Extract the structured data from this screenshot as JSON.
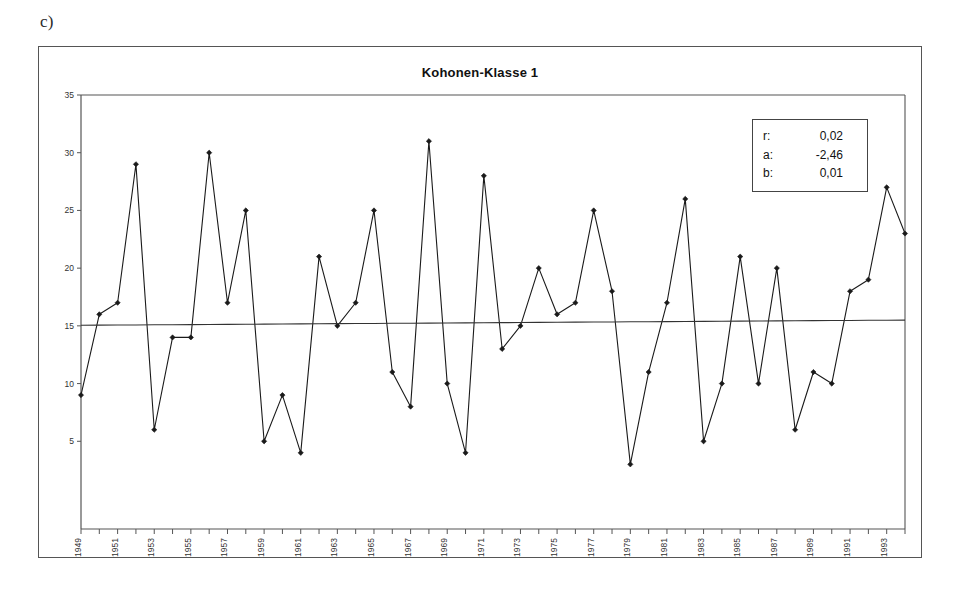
{
  "figure": {
    "panel_label": "c)"
  },
  "stats_box": {
    "rows": [
      {
        "key": "r:",
        "value": "0,02"
      },
      {
        "key": "a:",
        "value": "-2,46"
      },
      {
        "key": "b:",
        "value": "0,01"
      }
    ]
  },
  "chart_data": {
    "type": "line",
    "title": "Kohonen-Klasse 1",
    "xlabel": "",
    "ylabel": "",
    "ylim": [
      0,
      35
    ],
    "yticks": [
      0,
      5,
      10,
      15,
      20,
      25,
      30,
      35
    ],
    "ytick_labels": [
      "",
      "5",
      "10",
      "15",
      "20",
      "25",
      "30",
      "35"
    ],
    "grid": false,
    "legend_position": "none",
    "marker": "diamond",
    "x": [
      1949,
      1950,
      1951,
      1952,
      1953,
      1954,
      1955,
      1956,
      1957,
      1958,
      1959,
      1960,
      1961,
      1962,
      1963,
      1964,
      1965,
      1966,
      1967,
      1968,
      1969,
      1970,
      1971,
      1972,
      1973,
      1974,
      1975,
      1976,
      1977,
      1978,
      1979,
      1980,
      1981,
      1982,
      1983,
      1984,
      1985,
      1986,
      1987,
      1988,
      1989,
      1990,
      1991,
      1992,
      1993,
      1994
    ],
    "xtick_labels": [
      "1949",
      "",
      "1951",
      "",
      "1953",
      "",
      "1955",
      "",
      "1957",
      "",
      "1959",
      "",
      "1961",
      "",
      "1963",
      "",
      "1965",
      "",
      "1967",
      "",
      "1969",
      "",
      "1971",
      "",
      "1973",
      "",
      "1975",
      "",
      "1977",
      "",
      "1979",
      "",
      "1981",
      "",
      "1983",
      "",
      "1985",
      "",
      "1987",
      "",
      "1989",
      "",
      "1991",
      "",
      "1993",
      ""
    ],
    "series": [
      {
        "name": "Kohonen-Klasse 1",
        "kind": "data",
        "values": [
          9,
          16,
          17,
          29,
          6,
          14,
          14,
          30,
          17,
          25,
          5,
          9,
          4,
          21,
          15,
          17,
          25,
          11,
          8,
          31,
          10,
          4,
          28,
          13,
          15,
          20,
          16,
          17,
          25,
          18,
          3,
          11,
          17,
          26,
          5,
          10,
          21,
          10,
          20,
          6,
          11,
          10,
          18,
          19,
          27,
          23
        ]
      },
      {
        "name": "Trend",
        "kind": "trend",
        "values": [
          15.05,
          15.06,
          15.07,
          15.08,
          15.09,
          15.1,
          15.11,
          15.12,
          15.13,
          15.14,
          15.15,
          15.16,
          15.17,
          15.18,
          15.19,
          15.2,
          15.21,
          15.22,
          15.23,
          15.24,
          15.25,
          15.26,
          15.27,
          15.28,
          15.29,
          15.3,
          15.31,
          15.32,
          15.33,
          15.34,
          15.35,
          15.36,
          15.37,
          15.38,
          15.39,
          15.4,
          15.41,
          15.42,
          15.43,
          15.44,
          15.45,
          15.46,
          15.47,
          15.48,
          15.49,
          15.5
        ]
      }
    ]
  },
  "colors": {
    "line": "#1a1a1a",
    "trend": "#333333",
    "axis": "#555555",
    "frame": "#555555",
    "text": "#111111",
    "background": "#ffffff"
  }
}
